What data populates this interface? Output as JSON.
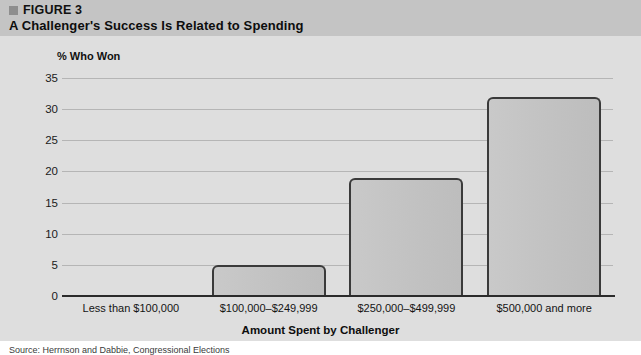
{
  "header": {
    "figure_number": "FIGURE 3",
    "title": "A Challenger's Success Is Related to Spending",
    "band_color": "#c4c4c4",
    "marker_color": "#8e8e8e"
  },
  "panel": {
    "background_color": "#dedede",
    "gridline_color": "#b5b5b5",
    "axis_color": "#2b2b2b"
  },
  "source": {
    "text": "Source: Herrnson and Dabbie, Congressional Elections"
  },
  "chart_data": {
    "type": "bar",
    "title": "A Challenger's Success Is Related to Spending",
    "categories": [
      "Less than $100,000",
      "$100,000–$249,999",
      "$250,000–$499,999",
      "$500,000 and more"
    ],
    "values": [
      0,
      5,
      19,
      32
    ],
    "xlabel": "Amount Spent by Challenger",
    "ylabel": "% Who Won",
    "ylim": [
      0,
      35
    ],
    "yticks": [
      0,
      5,
      10,
      15,
      20,
      25,
      30,
      35
    ],
    "ytick_labels": [
      "0",
      "5",
      "10",
      "15",
      "20",
      "25",
      "30",
      "35"
    ],
    "grid": true,
    "legend": false,
    "bar_fill_color": "#c4c4c4",
    "bar_edge_color": "#3a3a3a"
  }
}
